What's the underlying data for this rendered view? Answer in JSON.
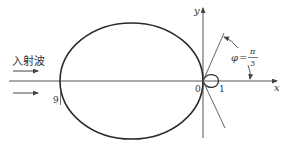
{
  "diagram": {
    "incident_wave_label": "入射波",
    "axis_x_label": "x",
    "axis_y_label": "y",
    "origin_label": "0",
    "loop_point_label": "1",
    "left_point_label": "9",
    "angle_label": {
      "symbol": "φ",
      "equals": "=",
      "numerator": "π",
      "denominator": "3"
    },
    "colors": {
      "curve": "#2a2a2a",
      "axis": "#555555",
      "text": "#333333"
    }
  }
}
